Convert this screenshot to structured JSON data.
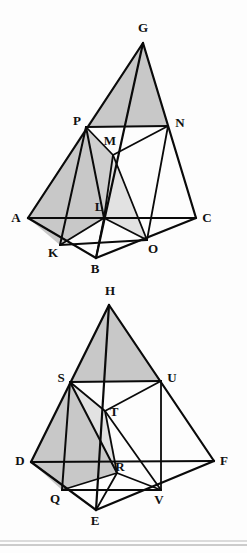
{
  "document": {
    "title": "Two tetrahedron diagrams with medial cross-sections",
    "background_color": "#fdfdfd",
    "ink_color": "#0a0a0a",
    "shade_color": "#c8c8c8",
    "shade_color_light": "#e2e2e2",
    "rule_color": "#b9b9b9"
  },
  "figures": [
    {
      "id": "figure-top",
      "name": "tetrahedron-upper",
      "vertices": {
        "G": {
          "x": 143,
          "y": 43,
          "label": "G",
          "label_x": 143,
          "label_y": 29
        },
        "P": {
          "x": 86,
          "y": 127,
          "label": "P",
          "label_x": 77,
          "label_y": 122
        },
        "N": {
          "x": 168,
          "y": 126,
          "label": "N",
          "label_x": 180,
          "label_y": 124
        },
        "M": {
          "x": 113,
          "y": 155,
          "label": "M",
          "label_x": 110,
          "label_y": 142
        },
        "A": {
          "x": 28,
          "y": 218,
          "label": "A",
          "label_x": 16,
          "label_y": 219
        },
        "L": {
          "x": 104,
          "y": 218,
          "label": "L",
          "label_x": 99,
          "label_y": 208
        },
        "C": {
          "x": 196,
          "y": 218,
          "label": "C",
          "label_x": 207,
          "label_y": 219
        },
        "K": {
          "x": 60,
          "y": 245,
          "label": "K",
          "label_x": 53,
          "label_y": 254
        },
        "O": {
          "x": 147,
          "y": 240,
          "label": "O",
          "label_x": 153,
          "label_y": 250
        },
        "B": {
          "x": 96,
          "y": 258,
          "label": "B",
          "label_x": 95,
          "label_y": 270
        }
      },
      "shaded_faces": [
        {
          "name": "face-G-P-N",
          "points": "G,P,N",
          "tone": "#c8c8c8"
        },
        {
          "name": "face-A-P-L-K",
          "points": "A,P,L,K",
          "tone": "#c8c8c8"
        },
        {
          "name": "face-P-M-L",
          "points": "P,M,L",
          "tone": "#cfcfcf"
        },
        {
          "name": "face-M-L-O",
          "points": "M,L,O",
          "tone": "#e2e2e2"
        }
      ],
      "edges": [
        {
          "name": "edge-G-A",
          "from": "G",
          "to": "A",
          "weight": 2.2
        },
        {
          "name": "edge-G-C",
          "from": "G",
          "to": "C",
          "weight": 2.2
        },
        {
          "name": "edge-G-B",
          "from": "G",
          "to": "B",
          "weight": 2.2
        },
        {
          "name": "edge-A-C",
          "from": "A",
          "to": "C",
          "weight": 2.2
        },
        {
          "name": "edge-A-B",
          "from": "A",
          "to": "B",
          "weight": 2.2
        },
        {
          "name": "edge-B-C",
          "from": "B",
          "to": "C",
          "weight": 2.2
        },
        {
          "name": "edge-P-N",
          "from": "P",
          "to": "N",
          "weight": 2.2
        },
        {
          "name": "edge-P-M",
          "from": "P",
          "to": "M",
          "weight": 1.8
        },
        {
          "name": "edge-M-N",
          "from": "M",
          "to": "N",
          "weight": 1.8
        },
        {
          "name": "edge-P-L",
          "from": "P",
          "to": "L",
          "weight": 2.0
        },
        {
          "name": "edge-M-L",
          "from": "M",
          "to": "L",
          "weight": 1.8
        },
        {
          "name": "edge-M-O",
          "from": "M",
          "to": "O",
          "weight": 1.8
        },
        {
          "name": "edge-N-O",
          "from": "N",
          "to": "O",
          "weight": 1.8
        },
        {
          "name": "edge-L-O",
          "from": "L",
          "to": "O",
          "weight": 1.8
        },
        {
          "name": "edge-L-K",
          "from": "L",
          "to": "K",
          "weight": 1.8
        },
        {
          "name": "edge-K-O",
          "from": "K",
          "to": "O",
          "weight": 1.8
        },
        {
          "name": "edge-P-K",
          "from": "P",
          "to": "K",
          "weight": 2.0
        },
        {
          "name": "edge-L-B",
          "from": "L",
          "to": "B",
          "weight": 1.8
        }
      ]
    },
    {
      "id": "figure-bottom",
      "name": "tetrahedron-lower",
      "vertices": {
        "H": {
          "x": 109,
          "y": 305,
          "label": "H",
          "label_x": 110,
          "label_y": 292
        },
        "S": {
          "x": 70,
          "y": 382,
          "label": "S",
          "label_x": 61,
          "label_y": 379
        },
        "U": {
          "x": 161,
          "y": 381,
          "label": "U",
          "label_x": 172,
          "label_y": 379
        },
        "T": {
          "x": 105,
          "y": 411,
          "label": "T",
          "label_x": 114,
          "label_y": 413
        },
        "D": {
          "x": 31,
          "y": 462,
          "label": "D",
          "label_x": 20,
          "label_y": 462
        },
        "R": {
          "x": 117,
          "y": 473,
          "label": "R",
          "label_x": 120,
          "label_y": 468
        },
        "F": {
          "x": 214,
          "y": 461,
          "label": "F",
          "label_x": 224,
          "label_y": 462
        },
        "Q": {
          "x": 62,
          "y": 490,
          "label": "Q",
          "label_x": 55,
          "label_y": 500
        },
        "V": {
          "x": 161,
          "y": 490,
          "label": "V",
          "label_x": 159,
          "label_y": 501
        },
        "E": {
          "x": 96,
          "y": 510,
          "label": "E",
          "label_x": 95,
          "label_y": 522
        }
      },
      "shaded_faces": [
        {
          "name": "face-H-S-U",
          "points": "H,S,U",
          "tone": "#c8c8c8"
        },
        {
          "name": "face-D-S-R-Q",
          "points": "D,S,R,Q",
          "tone": "#c8c8c8"
        },
        {
          "name": "face-S-T-R",
          "points": "S,T,R",
          "tone": "#e2e2e2"
        }
      ],
      "edges": [
        {
          "name": "edge-H-D",
          "from": "H",
          "to": "D",
          "weight": 2.2
        },
        {
          "name": "edge-H-F",
          "from": "H",
          "to": "F",
          "weight": 2.2
        },
        {
          "name": "edge-H-E",
          "from": "H",
          "to": "E",
          "weight": 2.2
        },
        {
          "name": "edge-D-F",
          "from": "D",
          "to": "F",
          "weight": 2.2
        },
        {
          "name": "edge-D-E",
          "from": "D",
          "to": "E",
          "weight": 2.2
        },
        {
          "name": "edge-E-F",
          "from": "E",
          "to": "F",
          "weight": 2.2
        },
        {
          "name": "edge-S-U",
          "from": "S",
          "to": "U",
          "weight": 2.2
        },
        {
          "name": "edge-S-T",
          "from": "S",
          "to": "T",
          "weight": 1.8
        },
        {
          "name": "edge-T-U",
          "from": "T",
          "to": "U",
          "weight": 1.8
        },
        {
          "name": "edge-S-R",
          "from": "S",
          "to": "R",
          "weight": 2.0
        },
        {
          "name": "edge-T-R",
          "from": "T",
          "to": "R",
          "weight": 1.8
        },
        {
          "name": "edge-T-V",
          "from": "T",
          "to": "V",
          "weight": 1.8
        },
        {
          "name": "edge-U-V",
          "from": "U",
          "to": "V",
          "weight": 1.8
        },
        {
          "name": "edge-R-V",
          "from": "R",
          "to": "V",
          "weight": 1.8
        },
        {
          "name": "edge-R-Q",
          "from": "R",
          "to": "Q",
          "weight": 1.8
        },
        {
          "name": "edge-Q-V",
          "from": "Q",
          "to": "V",
          "weight": 1.8
        },
        {
          "name": "edge-S-Q",
          "from": "S",
          "to": "Q",
          "weight": 2.0
        },
        {
          "name": "edge-R-E",
          "from": "R",
          "to": "E",
          "weight": 1.8
        }
      ]
    }
  ],
  "footer_rules": [
    {
      "name": "footer-rule-upper",
      "y": 541,
      "tone": "#b9b9b9"
    },
    {
      "name": "footer-rule-lower",
      "y": 545,
      "tone": "#9a9a9a"
    }
  ]
}
